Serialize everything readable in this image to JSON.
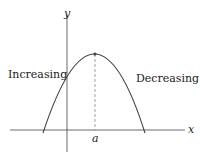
{
  "diagram": {
    "type": "function-graph",
    "axes": {
      "x_label": "x",
      "y_label": "y"
    },
    "curve": {
      "shape": "downward-parabola",
      "maximum_at": "a"
    },
    "labels": {
      "left": "Increasing",
      "right": "Decreasing",
      "tick": "a"
    },
    "colors": {
      "curve": "#444444",
      "axis": "#444444",
      "dash": "#777777"
    }
  }
}
